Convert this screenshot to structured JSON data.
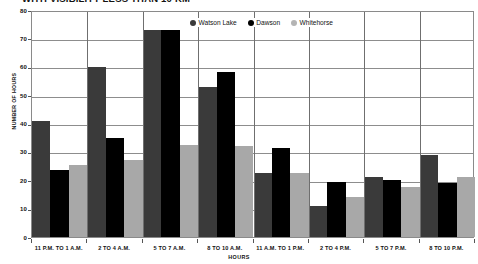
{
  "chart_data": {
    "type": "bar",
    "title": "WITH VISIBILITY LESS THAN 10 KM",
    "xlabel": "HOURS",
    "ylabel": "NUMBER OF HOURS",
    "ylim": [
      0,
      80
    ],
    "ytick_step": 10,
    "yticks": [
      0,
      10,
      20,
      30,
      40,
      50,
      60,
      70,
      80
    ],
    "grid": true,
    "legend_position": "top-center",
    "categories": [
      "11 P.M. TO 1 A.M.",
      "2 TO 4 A.M.",
      "5 TO 7 A.M.",
      "8 TO 10 A.M.",
      "11 A.M. TO 1 P.M.",
      "2 TO 4 P.M.",
      "5 TO 7 P.M.",
      "8 TO 10 P.M."
    ],
    "series": [
      {
        "name": "Watson Lake",
        "color": "#3a3a3a",
        "values": [
          41,
          60,
          73,
          53,
          22.5,
          11,
          21,
          29
        ]
      },
      {
        "name": "Dawson",
        "color": "#000000",
        "values": [
          23.5,
          35,
          73,
          58,
          31.5,
          19.5,
          20,
          19
        ]
      },
      {
        "name": "Whitehorse",
        "color": "#a8a8a8",
        "values": [
          25.5,
          27,
          32.5,
          32,
          22.5,
          14,
          17.5,
          21
        ]
      }
    ]
  }
}
